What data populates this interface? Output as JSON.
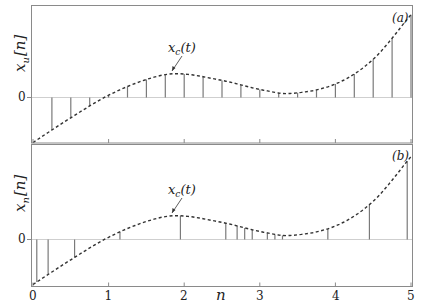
{
  "chart_data": [
    {
      "type": "stem",
      "panel_label": "(a)",
      "title": "",
      "xlabel": "",
      "ylabel": "x_u[n]",
      "ytick_labels": [
        "0"
      ],
      "xlim": [
        0,
        5
      ],
      "annotation": "x_c(t)",
      "annotation_at": [
        1.85,
        0.53
      ],
      "curve_name": "x_c(t)",
      "curve_style": "dashed",
      "sampling": "uniform",
      "stems_x": [
        0.25,
        0.5,
        0.75,
        1.0,
        1.25,
        1.5,
        1.75,
        2.0,
        2.25,
        2.5,
        2.75,
        3.0,
        3.25,
        3.5,
        3.75,
        4.0,
        4.25,
        4.5,
        4.75,
        5.0
      ]
    },
    {
      "type": "stem",
      "panel_label": "(b)",
      "title": "",
      "xlabel": "n",
      "ylabel": "x_n[n]",
      "ytick_labels": [
        "0"
      ],
      "xticks": [
        0,
        1,
        2,
        3,
        4,
        5
      ],
      "xtick_labels": [
        "0",
        "1",
        "2",
        "3",
        "4",
        "5"
      ],
      "xlim": [
        0,
        5
      ],
      "annotation": "x_c(t)",
      "annotation_at": [
        1.85,
        0.53
      ],
      "curve_name": "x_c(t)",
      "curve_style": "dashed",
      "sampling": "nonuniform",
      "stems_x": [
        0.05,
        0.2,
        0.55,
        1.15,
        1.95,
        2.55,
        2.7,
        2.8,
        2.9,
        3.1,
        3.2,
        3.3,
        3.9,
        4.45,
        4.95
      ]
    }
  ],
  "curve": {
    "description": "continuous-time signal x_c(t), cubic-like: starts at -1, peaks ~0.53 near t=1.9, dips to ~0.09 near t=3.4, rises to ~1.84 at t=5",
    "knots_t": [
      0,
      0.5,
      1.0,
      1.5,
      1.9,
      2.5,
      3.0,
      3.4,
      4.0,
      4.5,
      5.0
    ],
    "knots_x": [
      -1.0,
      -0.45,
      0.05,
      0.4,
      0.53,
      0.38,
      0.18,
      0.09,
      0.3,
      0.85,
      1.84
    ]
  },
  "labels": {
    "panel_a": "(a)",
    "panel_b": "(b)",
    "ylabel_a_main": "x",
    "ylabel_a_sub": "u",
    "ylabel_a_arg": "[n]",
    "ylabel_b_main": "x",
    "ylabel_b_sub": "n",
    "ylabel_b_arg": "[n]",
    "zero_a": "0",
    "zero_b": "0",
    "xlabel": "n",
    "annot_main": "x",
    "annot_sub": "c",
    "annot_arg": "(t)",
    "xt0": "0",
    "xt1": "1",
    "xt2": "2",
    "xt3": "3",
    "xt4": "4",
    "xt5": "5"
  }
}
